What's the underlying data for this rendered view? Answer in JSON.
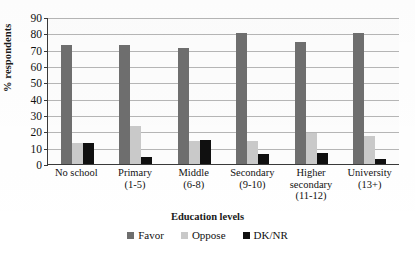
{
  "chart_data": {
    "type": "bar",
    "title": "",
    "xlabel": "Education levels",
    "ylabel": "% respondents",
    "ylim": [
      0,
      90
    ],
    "ytick_step": 10,
    "yticks": [
      0,
      10,
      20,
      30,
      40,
      50,
      60,
      70,
      80,
      90
    ],
    "grid": true,
    "legend_position": "bottom",
    "categories": [
      "No school",
      "Primary (1-5)",
      "Middle (6-8)",
      "Secondary (9-10)",
      "Higher secondary (11-12)",
      "University (13+)"
    ],
    "category_lines": [
      {
        "line1": "No school",
        "line2": "",
        "line3": ""
      },
      {
        "line1": "Primary",
        "line2": "(1-5)",
        "line3": ""
      },
      {
        "line1": "Middle",
        "line2": "(6-8)",
        "line3": ""
      },
      {
        "line1": "Secondary",
        "line2": "(9-10)",
        "line3": ""
      },
      {
        "line1": "Higher",
        "line2": "secondary",
        "line3": "(11-12)"
      },
      {
        "line1": "University",
        "line2": "(13+)",
        "line3": ""
      }
    ],
    "series": [
      {
        "name": "Favor",
        "color": "#6e6e6e",
        "values": [
          73,
          73,
          71,
          80,
          75,
          80
        ]
      },
      {
        "name": "Oppose",
        "color": "#c9c9c9",
        "values": [
          13,
          23,
          14,
          14,
          19,
          17
        ]
      },
      {
        "name": "DK/NR",
        "color": "#101010",
        "values": [
          13,
          4,
          15,
          6,
          7,
          3
        ]
      }
    ]
  },
  "axis": {
    "y_title": "% respondents",
    "x_title": "Education levels"
  },
  "legend": {
    "items": [
      {
        "label": "Favor",
        "color": "#6e6e6e"
      },
      {
        "label": "Oppose",
        "color": "#c9c9c9"
      },
      {
        "label": "DK/NR",
        "color": "#101010"
      }
    ]
  },
  "colors": {
    "favor": "#6e6e6e",
    "oppose": "#c9c9c9",
    "dknr": "#101010",
    "grid": "#b6b6b6",
    "axis": "#3a3a3a"
  }
}
